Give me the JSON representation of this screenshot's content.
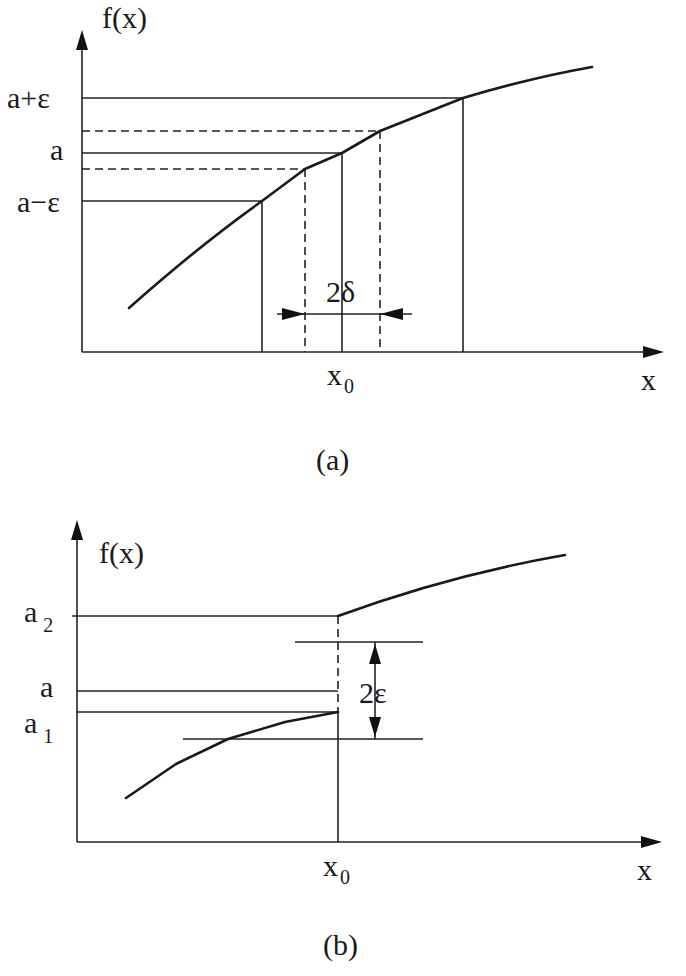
{
  "figure_a": {
    "caption": "(a)",
    "y_axis_label": "f(x)",
    "x_axis_label": "x",
    "y_ticks": {
      "upper": "a+ε",
      "mid": "a",
      "lower": "a−ε"
    },
    "x_tick": {
      "base": "x",
      "sub": "0"
    },
    "interval_label": "2δ"
  },
  "figure_b": {
    "caption": "(b)",
    "y_axis_label": "f(x)",
    "x_axis_label": "x",
    "y_ticks": {
      "a2": {
        "base": "a",
        "sub": "2"
      },
      "a": "a",
      "a1": {
        "base": "a",
        "sub": "1"
      }
    },
    "x_tick": {
      "base": "x",
      "sub": "0"
    },
    "interval_label": "2ε"
  },
  "colors": {
    "ink": "#1a1a1a",
    "background": "#ffffff"
  }
}
